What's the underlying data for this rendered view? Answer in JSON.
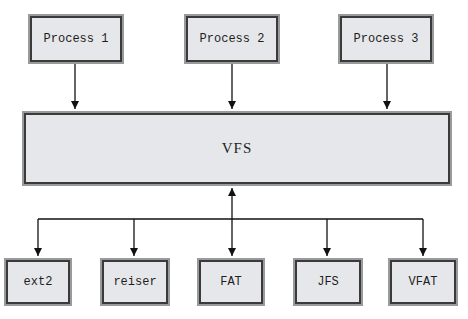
{
  "diagram": {
    "processes": [
      {
        "label": "Process 1"
      },
      {
        "label": "Process 2"
      },
      {
        "label": "Process 3"
      }
    ],
    "vfs": {
      "label": "VFS"
    },
    "filesystems": [
      {
        "label": "ext2"
      },
      {
        "label": "reiser"
      },
      {
        "label": "FAT"
      },
      {
        "label": "JFS"
      },
      {
        "label": "VFAT"
      }
    ],
    "colors": {
      "box_fill": "#e6e7ea",
      "box_border": "#3a3a3a",
      "box_shadow": "#9a9a9a",
      "line": "#111111"
    }
  }
}
